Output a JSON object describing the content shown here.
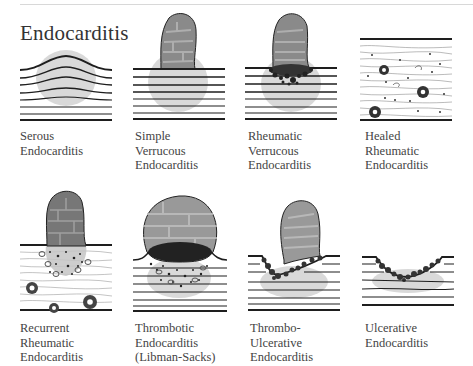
{
  "figure": {
    "title": "Endocarditis",
    "panels": [
      {
        "id": "serous",
        "label_lines": [
          "Serous",
          "Endocarditis"
        ]
      },
      {
        "id": "simple-verrucous",
        "label_lines": [
          "Simple",
          "Verrucous",
          "Endocarditis"
        ]
      },
      {
        "id": "rheumatic-verrucous",
        "label_lines": [
          "Rheumatic",
          "Verrucous",
          "Endocarditis"
        ]
      },
      {
        "id": "healed-rheumatic",
        "label_lines": [
          "Healed",
          "Rheumatic",
          "Endocarditis"
        ]
      },
      {
        "id": "recurrent-rheumatic",
        "label_lines": [
          "Recurrent",
          "Rheumatic",
          "Endocarditis"
        ]
      },
      {
        "id": "thrombotic",
        "label_lines": [
          "Thrombotic",
          "Endocarditis",
          "(Libman-Sacks)"
        ]
      },
      {
        "id": "thrombo-ulcerative",
        "label_lines": [
          "Thrombo-",
          "Ulcerative",
          "Endocarditis"
        ]
      },
      {
        "id": "ulcerative",
        "label_lines": [
          "Ulcerative",
          "Endocarditis"
        ]
      }
    ]
  },
  "colors": {
    "line": "#1e1e1e",
    "shade": "#c9c9c9",
    "vegetation": "#8a8a8a",
    "vegetation_dark": "#555555",
    "text": "#444444"
  }
}
